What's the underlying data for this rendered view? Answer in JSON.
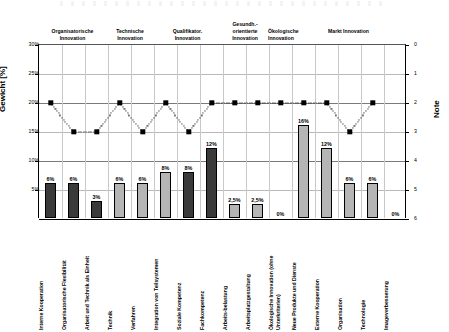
{
  "axes": {
    "left_title": "Gewicht [%]",
    "right_title": "Note",
    "left_ticks": [
      "30%",
      "25%",
      "20%",
      "15%",
      "10%",
      "5%"
    ],
    "right_ticks": [
      "0",
      "1",
      "2",
      "3",
      "4",
      "5",
      "6"
    ]
  },
  "groups": [
    {
      "label": "Organisatorische\nInnovation"
    },
    {
      "label": "Technische\nInnovation"
    },
    {
      "label": "Qualifikator.\nInnovation"
    },
    {
      "label": "Gesundh.-\norientierte\nInnovation"
    },
    {
      "label": "Ökologische\nInnovation"
    },
    {
      "label": "Markt Innovation"
    }
  ],
  "chart_data": {
    "type": "bar",
    "title": "",
    "xlabel": "",
    "ylabel": "Gewicht [%]",
    "ylim": [
      0,
      30
    ],
    "y2label": "Note",
    "y2lim": [
      0,
      6
    ],
    "y2_inverted": true,
    "grid": true,
    "legend": "none",
    "categories": [
      "Interne Kooperation",
      "Organisatorische Flexibilität",
      "Arbeit und Technik als Einheit",
      "Technik",
      "Verfahren",
      "Integration von Teilsystemen",
      "Soziale Kompetenz",
      "Fachkompetenz",
      "Arbeits-belastung",
      "Arbeitsplatzgestaltung",
      "Ökologische Innovation (ohne Unterkriterien)",
      "Neue Produkte und Dienste",
      "Externe Kooperation",
      "Organisation",
      "Technologie",
      "Imageverbesserung"
    ],
    "series": [
      {
        "name": "Gewicht [%]",
        "type": "bar",
        "axis": "left",
        "values": [
          6,
          6,
          3,
          6,
          6,
          8,
          8,
          12,
          2.5,
          2.5,
          0,
          16,
          12,
          6,
          6,
          0
        ],
        "labels": [
          "6%",
          "6%",
          "3%",
          "6%",
          "6%",
          "8%",
          "8%",
          "12%",
          "2,5%",
          "2,5%",
          "0%",
          "16%",
          "12%",
          "6%",
          "6%",
          "0%"
        ]
      },
      {
        "name": "Note",
        "type": "line-marker",
        "axis": "right",
        "values": [
          2,
          3,
          3,
          2,
          3,
          2,
          3,
          2,
          2,
          2,
          2,
          2,
          2,
          3,
          2,
          null
        ]
      }
    ]
  }
}
